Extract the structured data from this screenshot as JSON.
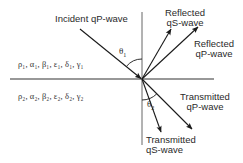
{
  "diagram": {
    "type": "wave-reflection-transmission",
    "colors": {
      "line": "#1a1a1a",
      "axis": "#444444",
      "text": "#2a2a2a"
    },
    "interface": {
      "y": 79,
      "x_start": 10,
      "x_end": 214
    },
    "normal": {
      "x": 142,
      "y_start": 12,
      "y_end": 145
    },
    "origin": {
      "x": 142,
      "y": 79
    },
    "waves": [
      {
        "id": "incident-qp",
        "label": "Incident qP-wave",
        "from": [
          80,
          29
        ],
        "to": [
          142,
          79
        ]
      },
      {
        "id": "reflected-qs",
        "label_line1": "Reflected",
        "label_line2": "qS-wave",
        "from": [
          142,
          79
        ],
        "to": [
          171,
          29
        ]
      },
      {
        "id": "reflected-qp",
        "label_line1": "Reflected",
        "label_line2": "qP-wave",
        "from": [
          142,
          79
        ],
        "to": [
          198,
          27
        ]
      },
      {
        "id": "transmitted-qp",
        "label_line1": "Transmitted",
        "label_line2": "qP-wave",
        "from": [
          142,
          79
        ],
        "to": [
          192,
          129
        ]
      },
      {
        "id": "transmitted-qs",
        "label_line1": "Transmitted",
        "label_line2": "qS-wave",
        "from": [
          142,
          79
        ],
        "to": [
          161,
          132
        ]
      }
    ],
    "angles": [
      {
        "symbol": "θ",
        "subscript": "1"
      },
      {
        "symbol": "θ",
        "subscript": "2"
      }
    ],
    "media": {
      "upper": "ρ₁, α₁, β₁, ε₁, δ₁, γ₁",
      "lower": "ρ₂, α₂, β₂, ε₂, δ₂, γ₂"
    }
  }
}
